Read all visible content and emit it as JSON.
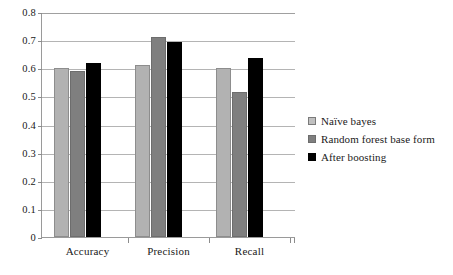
{
  "chart_data": {
    "type": "bar",
    "title": "",
    "xlabel": "",
    "ylabel": "",
    "ylim": [
      0,
      0.8
    ],
    "ytick_step": 0.1,
    "grid": true,
    "legend_position": "right",
    "categories": [
      "Accuracy",
      "Precision",
      "Recall"
    ],
    "ytick_labels": [
      "0.8",
      "0.7",
      "0.6",
      "0.5",
      "0.4",
      "0.3",
      "0.2",
      "0.1",
      "0"
    ],
    "ytick_values": [
      0.8,
      0.7,
      0.6,
      0.5,
      0.4,
      0.3,
      0.2,
      0.1,
      0
    ],
    "series": [
      {
        "name": "Naïve bayes",
        "color": "#b2b2b2",
        "values": [
          0.6,
          0.61,
          0.6
        ]
      },
      {
        "name": "Random forest base form",
        "color": "#7f7f7f",
        "values": [
          0.59,
          0.71,
          0.515
        ]
      },
      {
        "name": "After boosting",
        "color": "#000000",
        "values": [
          0.62,
          0.695,
          0.635
        ]
      }
    ]
  },
  "legend": {
    "items": [
      {
        "label": "Naïve bayes"
      },
      {
        "label": "Random forest base form"
      },
      {
        "label": "After boosting"
      }
    ]
  },
  "axes": {
    "y": {
      "labels": [
        "0.8",
        "0.7",
        "0.6",
        "0.5",
        "0.4",
        "0.3",
        "0.2",
        "0.1",
        "0"
      ]
    },
    "x": {
      "labels": [
        "Accuracy",
        "Precision",
        "Recall"
      ]
    }
  },
  "colors": {
    "series_1": "#b2b2b2",
    "series_2": "#7f7f7f",
    "series_3": "#000000",
    "gridline": "#b4b4b4",
    "axis": "#9a9a9a",
    "background": "#ffffff"
  }
}
